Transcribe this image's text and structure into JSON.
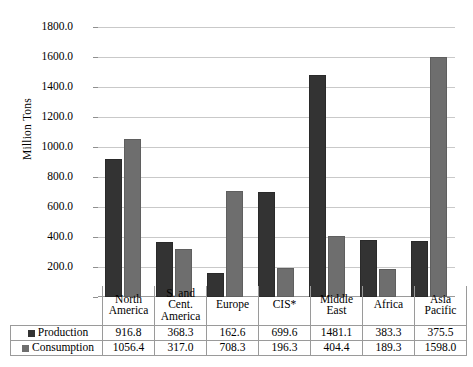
{
  "chart_data": {
    "type": "bar",
    "title": "",
    "xlabel": "",
    "ylabel": "Million Tons",
    "ylim": [
      0,
      1800
    ],
    "ytick_step": 200,
    "grid": true,
    "legend_position": "table-left",
    "categories": [
      "North America",
      "S. and Cent. America",
      "Europe",
      "CIS*",
      "Middle East",
      "Africa",
      "Asia Pacific"
    ],
    "series": [
      {
        "name": "Production",
        "color": "#333333",
        "values": [
          916.8,
          368.3,
          162.6,
          699.6,
          1481.1,
          383.3,
          375.5
        ]
      },
      {
        "name": "Consumption",
        "color": "#6e6e6e",
        "values": [
          1056.4,
          317.0,
          708.3,
          196.3,
          404.4,
          189.3,
          1598.0
        ]
      }
    ],
    "ytick_labels": [
      "1800.0",
      "1600.0",
      "1400.0",
      "1200.0",
      "1000.0",
      "800.0",
      "600.0",
      "400.0",
      "200.0"
    ]
  },
  "table": {
    "category_labels": [
      [
        "North",
        "America"
      ],
      [
        "S. and",
        "Cent.",
        "America"
      ],
      [
        "Europe"
      ],
      [
        "CIS*"
      ],
      [
        "Middle",
        "East"
      ],
      [
        "Africa"
      ],
      [
        "Asia",
        "Pacific"
      ]
    ],
    "rows": [
      {
        "label": "Production",
        "values": [
          "916.8",
          "368.3",
          "162.6",
          "699.6",
          "1481.1",
          "383.3",
          "375.5"
        ]
      },
      {
        "label": "Consumption",
        "values": [
          "1056.4",
          "317.0",
          "708.3",
          "196.3",
          "404.4",
          "189.3",
          "1598.0"
        ]
      }
    ]
  }
}
